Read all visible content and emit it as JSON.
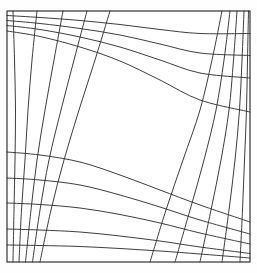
{
  "figure": {
    "canvas": {
      "width": 257,
      "height": 273
    },
    "background_color": "#fefefe",
    "line_color": "#333333",
    "frame_color": "#2b2b2b",
    "line_width": 0.95,
    "frame_width": 1.15
  },
  "chart_data": {
    "type": "line",
    "xlabel": "",
    "ylabel": "",
    "grid": true,
    "legend": "none",
    "xlim": [
      7,
      250
    ],
    "ylim": [
      11,
      262
    ],
    "frame": {
      "x0": 7,
      "y0": 11,
      "x1": 250,
      "y1": 262
    },
    "families": [
      {
        "name": "u-family",
        "orientation": "quasi-horizontal",
        "count": 9,
        "note": "Lines run left edge to right edge; clustered near top-left and bottom-left, sparse through the middle."
      },
      {
        "name": "v-family",
        "orientation": "quasi-vertical",
        "count": 10,
        "note": "Lines run top edge to bottom edge; clustered near top-right and bottom-left, sparse through the middle."
      }
    ],
    "u_curves": [
      {
        "index": 0,
        "points": [
          [
            7,
            15.5
          ],
          [
            40,
            17.5
          ],
          [
            80,
            20.5
          ],
          [
            120,
            24.5
          ],
          [
            160,
            29.5
          ],
          [
            200,
            33.5
          ],
          [
            250,
            33.5
          ]
        ]
      },
      {
        "index": 1,
        "points": [
          [
            7,
            20.5
          ],
          [
            40,
            23.5
          ],
          [
            80,
            28.5
          ],
          [
            120,
            35.0
          ],
          [
            160,
            44.0
          ],
          [
            200,
            53.0
          ],
          [
            250,
            55.5
          ]
        ]
      },
      {
        "index": 2,
        "points": [
          [
            7,
            25.5
          ],
          [
            40,
            29.5
          ],
          [
            80,
            37.0
          ],
          [
            120,
            47.0
          ],
          [
            160,
            60.0
          ],
          [
            200,
            73.0
          ],
          [
            250,
            78.0
          ]
        ]
      },
      {
        "index": 3,
        "points": [
          [
            7,
            31.0
          ],
          [
            40,
            36.5
          ],
          [
            80,
            47.0
          ],
          [
            120,
            61.0
          ],
          [
            160,
            80.0
          ],
          [
            200,
            100.0
          ],
          [
            250,
            112.0
          ]
        ]
      },
      {
        "index": 4,
        "points": [
          [
            7,
            152.0
          ],
          [
            40,
            155.0
          ],
          [
            80,
            162.0
          ],
          [
            120,
            175.0
          ],
          [
            160,
            190.0
          ],
          [
            200,
            205.0
          ],
          [
            250,
            222.0
          ]
        ]
      },
      {
        "index": 5,
        "points": [
          [
            7,
            178.0
          ],
          [
            40,
            180.0
          ],
          [
            80,
            185.0
          ],
          [
            120,
            195.0
          ],
          [
            160,
            207.0
          ],
          [
            200,
            220.0
          ],
          [
            250,
            234.0
          ]
        ]
      },
      {
        "index": 6,
        "points": [
          [
            7,
            203.0
          ],
          [
            40,
            204.5
          ],
          [
            80,
            208.0
          ],
          [
            120,
            214.5
          ],
          [
            160,
            223.0
          ],
          [
            200,
            233.0
          ],
          [
            250,
            244.0
          ]
        ]
      },
      {
        "index": 7,
        "points": [
          [
            7,
            229.0
          ],
          [
            40,
            230.0
          ],
          [
            80,
            232.0
          ],
          [
            120,
            236.0
          ],
          [
            160,
            241.0
          ],
          [
            200,
            247.0
          ],
          [
            250,
            253.5
          ]
        ]
      },
      {
        "index": 8,
        "points": [
          [
            7,
            245.0
          ],
          [
            40,
            245.5
          ],
          [
            80,
            246.5
          ],
          [
            120,
            248.5
          ],
          [
            160,
            251.0
          ],
          [
            200,
            254.0
          ],
          [
            250,
            258.0
          ]
        ]
      }
    ],
    "v_curves": [
      {
        "index": 0,
        "points": [
          [
            13.0,
            11
          ],
          [
            14.5,
            60
          ],
          [
            15.5,
            110
          ],
          [
            15.0,
            160
          ],
          [
            14.0,
            210
          ],
          [
            13.0,
            262
          ]
        ]
      },
      {
        "index": 1,
        "points": [
          [
            37.0,
            11
          ],
          [
            32.0,
            60
          ],
          [
            28.0,
            110
          ],
          [
            25.0,
            160
          ],
          [
            21.5,
            210
          ],
          [
            19.0,
            262
          ]
        ]
      },
      {
        "index": 2,
        "points": [
          [
            63.0,
            11
          ],
          [
            54.0,
            60
          ],
          [
            45.0,
            110
          ],
          [
            37.0,
            160
          ],
          [
            31.0,
            210
          ],
          [
            25.5,
            262
          ]
        ]
      },
      {
        "index": 3,
        "points": [
          [
            87.0,
            11
          ],
          [
            74.0,
            60
          ],
          [
            61.0,
            110
          ],
          [
            49.0,
            160
          ],
          [
            40.0,
            210
          ],
          [
            32.5,
            262
          ]
        ]
      },
      {
        "index": 4,
        "points": [
          [
            110.0,
            11
          ],
          [
            95.0,
            60
          ],
          [
            79.0,
            110
          ],
          [
            64.0,
            160
          ],
          [
            51.0,
            210
          ],
          [
            40.0,
            262
          ]
        ]
      },
      {
        "index": 5,
        "points": [
          [
            222.0,
            11
          ],
          [
            212.0,
            60
          ],
          [
            200.0,
            110
          ],
          [
            183.0,
            160
          ],
          [
            166.0,
            210
          ],
          [
            150.0,
            262
          ]
        ]
      },
      {
        "index": 6,
        "points": [
          [
            230.0,
            11
          ],
          [
            224.0,
            60
          ],
          [
            216.0,
            110
          ],
          [
            204.0,
            160
          ],
          [
            190.0,
            210
          ],
          [
            175.0,
            262
          ]
        ]
      },
      {
        "index": 7,
        "points": [
          [
            237.0,
            11
          ],
          [
            233.5,
            60
          ],
          [
            229.0,
            110
          ],
          [
            221.0,
            160
          ],
          [
            211.0,
            210
          ],
          [
            200.0,
            262
          ]
        ]
      },
      {
        "index": 8,
        "points": [
          [
            244.0,
            11
          ],
          [
            242.0,
            60
          ],
          [
            239.5,
            110
          ],
          [
            235.0,
            160
          ],
          [
            229.0,
            210
          ],
          [
            222.0,
            262
          ]
        ]
      },
      {
        "index": 9,
        "points": [
          [
            248.5,
            11
          ],
          [
            247.5,
            60
          ],
          [
            246.5,
            110
          ],
          [
            244.5,
            160
          ],
          [
            242.5,
            210
          ],
          [
            240.0,
            262
          ]
        ]
      }
    ]
  }
}
